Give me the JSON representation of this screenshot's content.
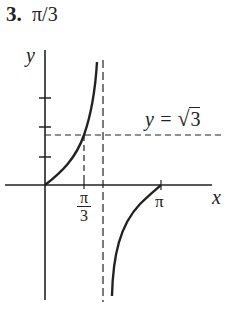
{
  "problem": {
    "number": "3.",
    "answer": "π/3"
  },
  "diagram": {
    "axes": {
      "x_label": "x",
      "y_label": "y"
    },
    "x_ticks": [
      {
        "label_num": "π",
        "label_den": "3",
        "value": "π/3"
      },
      {
        "label": "π",
        "value": "π"
      }
    ],
    "y_ticks_count": 3,
    "horizontal_line": {
      "label": "y = ",
      "sqrt_symbol": "√",
      "radicand": "3"
    },
    "asymptote": "x = π/2",
    "curve": "y = tan x",
    "colors": {
      "ink": "#222222",
      "background": "#ffffff"
    }
  }
}
